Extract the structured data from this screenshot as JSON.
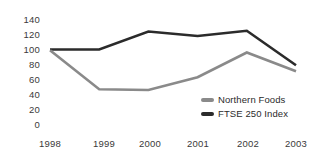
{
  "chart_data": {
    "type": "line",
    "title": "",
    "xlabel": "",
    "ylabel": "",
    "categories": [
      "1998",
      "1999",
      "2000",
      "2001",
      "2002",
      "2003"
    ],
    "x": [
      1998,
      1999,
      2000,
      2001,
      2002,
      2003
    ],
    "ylim": [
      0,
      140
    ],
    "ytick_labels": [
      "140",
      "120",
      "100",
      "80",
      "60",
      "40",
      "20",
      "0"
    ],
    "ytick_values": [
      140,
      120,
      100,
      80,
      60,
      40,
      20,
      0
    ],
    "grid": false,
    "legend_position": "inside-lower-right",
    "series": [
      {
        "name": "Northern Foods",
        "color": "#8a8a8a",
        "values": [
          99,
          47,
          46,
          63,
          96,
          71
        ]
      },
      {
        "name": "FTSE 250 Index",
        "color": "#2b2b2b",
        "values": [
          100,
          100,
          124,
          118,
          125,
          79
        ]
      }
    ]
  },
  "legend": {
    "items": [
      {
        "label": "Northern Foods",
        "swatch_color": "#8a8a8a"
      },
      {
        "label": "FTSE 250 Index",
        "swatch_color": "#2b2b2b"
      }
    ]
  },
  "axes": {
    "y_ticks": [
      {
        "label": "140"
      },
      {
        "label": "120"
      },
      {
        "label": "100"
      },
      {
        "label": "80"
      },
      {
        "label": "60"
      },
      {
        "label": "40"
      },
      {
        "label": "20"
      },
      {
        "label": "0"
      }
    ],
    "x_ticks": [
      {
        "label": "1998"
      },
      {
        "label": "1999"
      },
      {
        "label": "2000"
      },
      {
        "label": "2001"
      },
      {
        "label": "2002"
      },
      {
        "label": "2003"
      }
    ]
  }
}
